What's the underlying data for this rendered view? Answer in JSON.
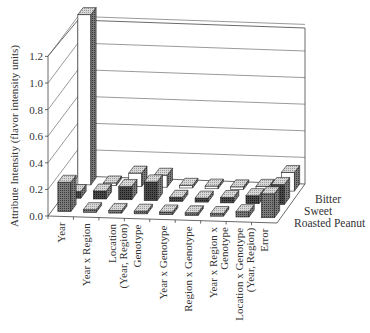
{
  "chart_data": {
    "type": "bar",
    "subtype": "3d-grouped-bar",
    "title": "",
    "xlabel": "",
    "ylabel": "Attribute Intensity (flavor intensity units)",
    "ylim": [
      0.0,
      1.2
    ],
    "yticks": [
      "0.0",
      "0.2",
      "0.4",
      "0.6",
      "0.8",
      "1.0",
      "1.2"
    ],
    "grid": true,
    "legend_position": "right (depth axis labels)",
    "categories": [
      "Year",
      "Year x Region",
      "Location (Year, Region)",
      "Genotype",
      "Year x Genotype",
      "Region x Genotype",
      "Year x Region x Genotype",
      "Location x Genotype (Year, Region)",
      "Error"
    ],
    "series": [
      {
        "name": "Roasted Peanut",
        "values": [
          0.22,
          0.02,
          0.02,
          0.02,
          0.02,
          0.02,
          0.02,
          0.04,
          0.18
        ]
      },
      {
        "name": "Sweet",
        "values": [
          0.05,
          0.06,
          0.1,
          0.14,
          0.03,
          0.03,
          0.04,
          0.06,
          0.15
        ]
      },
      {
        "name": "Bitter",
        "values": [
          1.28,
          0.02,
          0.1,
          0.09,
          0.02,
          0.02,
          0.02,
          0.03,
          0.14
        ]
      }
    ]
  },
  "labels": {
    "ylabel": "Attribute Intensity (flavor intensity units)",
    "yticks": [
      "0.0",
      "0.2",
      "0.4",
      "0.6",
      "0.8",
      "1.0",
      "1.2"
    ],
    "categories": [
      [
        "Year"
      ],
      [
        "Year x Region"
      ],
      [
        "Location",
        "(Year, Region)"
      ],
      [
        "Genotype"
      ],
      [
        "Year x Genotype"
      ],
      [
        "Region x Genotype"
      ],
      [
        "Year x Region x",
        "Genotype"
      ],
      [
        "Location x Genotype",
        "(Year, Region)"
      ],
      [
        "Error"
      ]
    ],
    "legend": [
      "Bitter",
      "Sweet",
      "Roasted Peanut"
    ]
  }
}
